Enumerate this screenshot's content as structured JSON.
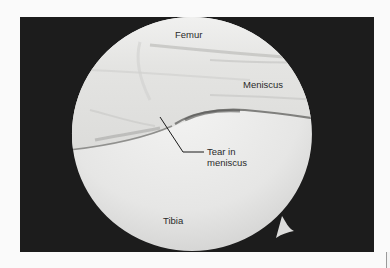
{
  "figure": {
    "kind": "arthroscopic-view",
    "colors": {
      "page_background": "#fafafa",
      "frame_background": "#1c1c1c",
      "tissue_light": "#e8e8e6",
      "tissue_shadow": "#9a9a98",
      "tear_line": "#1a1a1a",
      "label_text": "#2a2a2a"
    }
  },
  "labels": {
    "femur": "Femur",
    "meniscus": "Meniscus",
    "tear_line1": "Tear in",
    "tear_line2": "meniscus",
    "tibia": "Tibia"
  }
}
